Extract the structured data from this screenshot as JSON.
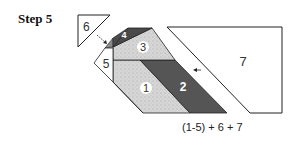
{
  "title": "Step 5",
  "formula": "(1-5) + 6 + 7",
  "pieces": {
    "p1": {
      "label": "1",
      "fill": "#d4d4d4"
    },
    "p2": {
      "label": "2",
      "fill": "#555555"
    },
    "p3": {
      "label": "3",
      "fill": "#d8d8d8"
    },
    "p4": {
      "label": "4",
      "fill": "#4a4a4a"
    },
    "p4b": {
      "fill": "#8a8a8a"
    },
    "p5": {
      "label": "5",
      "fill": "#ffffff"
    },
    "p6": {
      "label": "6",
      "fill": "#ffffff"
    },
    "p7": {
      "label": "7",
      "fill": "#ffffff"
    }
  },
  "stroke": "#222222"
}
